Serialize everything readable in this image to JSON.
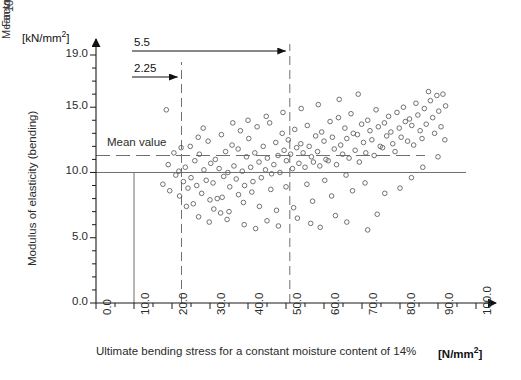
{
  "chart_data": {
    "type": "scatter",
    "title": "",
    "xlabel": "Ultimate bending stress for a constant moisture content of 14%",
    "xunit": "[N/mm2]",
    "ylabel": "Modulus of elasticity (bending)",
    "yunit": "[kN/mm2]",
    "xlim": [
      0.0,
      100.0
    ],
    "ylim": [
      0.0,
      19.0
    ],
    "xticks": [
      "0.0",
      "10.0",
      "20.0",
      "30.0",
      "40.0",
      "50.0",
      "60.0",
      "70.0",
      "80.0",
      "90.0",
      "100.0"
    ],
    "xtick_values": [
      0,
      10,
      20,
      30,
      40,
      50,
      60,
      70,
      80,
      90,
      100
    ],
    "xminor_step": 5,
    "yticks": [
      "0.0",
      "5.0",
      "10.0",
      "15.0",
      "19.0"
    ],
    "ytick_values": [
      0,
      5,
      10,
      15,
      19
    ],
    "yminor_step": 1,
    "grid": false,
    "legend": "none",
    "marker": "open-circle",
    "annotations": {
      "dim_upper_label": "5.5",
      "dim_upper_from": 10.0,
      "dim_upper_to": 51.0,
      "dim_lower_label": "2.25",
      "dim_lower_from": 10.0,
      "dim_lower_to": 22.5,
      "mean_value_horizontal_label": "Mean value",
      "mean_value_horizontal_y": 11.3,
      "mean_value_vertical_label": "Mean value",
      "mean_value_vertical_x": 51.0,
      "permissible_stress_label_line1": "Permissible stress",
      "permissible_stress_label_line2": "10 N/mm",
      "permissible_stress_label_sup": "2",
      "permissible_stress_x": 10.0,
      "permissible_stress_y_top": 10.0,
      "factor_of_safety_label": "Factor of safety",
      "factor_of_safety_x": 22.5,
      "solid_ref_y": 10.0
    },
    "points": [
      [
        18.5,
        14.8
      ],
      [
        19.0,
        10.6
      ],
      [
        17.6,
        9.1
      ],
      [
        19.4,
        8.6
      ],
      [
        21.0,
        9.8
      ],
      [
        22.0,
        8.2
      ],
      [
        21.8,
        10.1
      ],
      [
        23.0,
        9.3
      ],
      [
        23.5,
        10.4
      ],
      [
        24.2,
        8.8
      ],
      [
        25.0,
        9.6
      ],
      [
        25.6,
        7.6
      ],
      [
        26.0,
        10.9
      ],
      [
        26.5,
        9.0
      ],
      [
        27.2,
        11.4
      ],
      [
        27.8,
        8.4
      ],
      [
        28.4,
        10.2
      ],
      [
        29.0,
        9.4
      ],
      [
        29.5,
        12.4
      ],
      [
        30.2,
        10.7
      ],
      [
        30.8,
        9.2
      ],
      [
        31.4,
        11.0
      ],
      [
        31.9,
        8.0
      ],
      [
        32.4,
        10.3
      ],
      [
        33.0,
        12.9
      ],
      [
        33.6,
        9.7
      ],
      [
        34.1,
        11.6
      ],
      [
        34.7,
        10.0
      ],
      [
        35.2,
        8.9
      ],
      [
        35.8,
        12.1
      ],
      [
        36.3,
        10.5
      ],
      [
        36.9,
        9.5
      ],
      [
        37.4,
        11.8
      ],
      [
        38.0,
        13.2
      ],
      [
        38.5,
        10.1
      ],
      [
        39.1,
        9.0
      ],
      [
        39.6,
        11.2
      ],
      [
        40.2,
        12.6
      ],
      [
        40.7,
        10.4
      ],
      [
        41.3,
        9.3
      ],
      [
        41.8,
        11.5
      ],
      [
        42.4,
        13.5
      ],
      [
        42.9,
        10.8
      ],
      [
        43.5,
        9.6
      ],
      [
        44.0,
        12.0
      ],
      [
        44.6,
        10.2
      ],
      [
        45.1,
        11.1
      ],
      [
        45.7,
        13.8
      ],
      [
        46.2,
        9.9
      ],
      [
        46.8,
        10.6
      ],
      [
        47.3,
        12.3
      ],
      [
        47.9,
        11.3
      ],
      [
        48.4,
        10.0
      ],
      [
        49.0,
        13.0
      ],
      [
        49.5,
        11.7
      ],
      [
        50.1,
        10.9
      ],
      [
        50.6,
        12.5
      ],
      [
        51.2,
        11.4
      ],
      [
        51.7,
        10.3
      ],
      [
        52.3,
        13.3
      ],
      [
        52.8,
        11.9
      ],
      [
        53.4,
        10.7
      ],
      [
        53.9,
        12.2
      ],
      [
        54.5,
        11.5
      ],
      [
        55.0,
        10.4
      ],
      [
        55.6,
        13.6
      ],
      [
        56.1,
        12.0
      ],
      [
        56.7,
        11.2
      ],
      [
        57.2,
        10.8
      ],
      [
        57.8,
        12.8
      ],
      [
        58.3,
        11.6
      ],
      [
        58.9,
        10.5
      ],
      [
        59.4,
        13.1
      ],
      [
        60.0,
        12.4
      ],
      [
        60.5,
        11.0
      ],
      [
        61.1,
        10.9
      ],
      [
        61.6,
        13.9
      ],
      [
        62.2,
        12.7
      ],
      [
        62.7,
        11.8
      ],
      [
        63.3,
        10.6
      ],
      [
        63.8,
        14.2
      ],
      [
        64.4,
        12.1
      ],
      [
        64.9,
        11.4
      ],
      [
        65.5,
        13.4
      ],
      [
        66.0,
        12.6
      ],
      [
        66.6,
        11.1
      ],
      [
        67.1,
        14.5
      ],
      [
        67.7,
        13.0
      ],
      [
        68.2,
        11.7
      ],
      [
        68.8,
        12.9
      ],
      [
        69.3,
        10.8
      ],
      [
        69.9,
        13.7
      ],
      [
        70.4,
        12.3
      ],
      [
        71.0,
        11.5
      ],
      [
        71.5,
        14.0
      ],
      [
        72.1,
        13.2
      ],
      [
        72.6,
        12.5
      ],
      [
        73.2,
        11.3
      ],
      [
        73.7,
        14.8
      ],
      [
        74.3,
        13.5
      ],
      [
        74.8,
        12.0
      ],
      [
        75.4,
        11.9
      ],
      [
        75.9,
        13.8
      ],
      [
        76.5,
        12.8
      ],
      [
        77.0,
        14.3
      ],
      [
        77.6,
        13.1
      ],
      [
        78.1,
        12.2
      ],
      [
        78.7,
        11.6
      ],
      [
        79.2,
        14.6
      ],
      [
        79.8,
        13.4
      ],
      [
        80.3,
        12.7
      ],
      [
        80.9,
        15.0
      ],
      [
        81.4,
        13.9
      ],
      [
        82.0,
        12.4
      ],
      [
        82.5,
        14.1
      ],
      [
        83.1,
        13.6
      ],
      [
        83.6,
        12.1
      ],
      [
        84.2,
        15.3
      ],
      [
        84.7,
        14.4
      ],
      [
        85.3,
        13.2
      ],
      [
        85.8,
        12.6
      ],
      [
        86.4,
        14.9
      ],
      [
        86.9,
        13.7
      ],
      [
        87.5,
        16.2
      ],
      [
        88.0,
        15.5
      ],
      [
        88.6,
        14.2
      ],
      [
        89.1,
        13.0
      ],
      [
        89.7,
        15.9
      ],
      [
        90.2,
        14.7
      ],
      [
        90.8,
        13.5
      ],
      [
        91.3,
        16.0
      ],
      [
        92.0,
        15.1
      ],
      [
        24.8,
        12.0
      ],
      [
        26.9,
        12.7
      ],
      [
        28.2,
        13.4
      ],
      [
        30.0,
        7.9
      ],
      [
        31.0,
        7.2
      ],
      [
        33.2,
        8.1
      ],
      [
        35.0,
        7.0
      ],
      [
        36.0,
        13.8
      ],
      [
        37.5,
        8.3
      ],
      [
        38.8,
        7.7
      ],
      [
        40.0,
        14.0
      ],
      [
        41.0,
        8.5
      ],
      [
        43.0,
        7.4
      ],
      [
        44.8,
        14.3
      ],
      [
        46.0,
        8.7
      ],
      [
        47.5,
        7.1
      ],
      [
        49.2,
        14.6
      ],
      [
        50.0,
        8.9
      ],
      [
        52.0,
        7.3
      ],
      [
        54.0,
        14.9
      ],
      [
        55.5,
        9.1
      ],
      [
        57.0,
        7.8
      ],
      [
        58.5,
        15.2
      ],
      [
        60.2,
        9.4
      ],
      [
        62.0,
        8.2
      ],
      [
        64.0,
        15.6
      ],
      [
        65.8,
        9.8
      ],
      [
        67.5,
        8.6
      ],
      [
        69.0,
        16.0
      ],
      [
        70.8,
        9.2
      ],
      [
        20.5,
        11.5
      ],
      [
        22.4,
        11.9
      ],
      [
        23.8,
        7.4
      ],
      [
        27.0,
        6.6
      ],
      [
        29.8,
        6.2
      ],
      [
        32.8,
        6.9
      ],
      [
        34.5,
        6.4
      ],
      [
        39.0,
        6.0
      ],
      [
        42.0,
        5.7
      ],
      [
        45.0,
        6.3
      ],
      [
        48.0,
        5.9
      ],
      [
        53.0,
        6.5
      ],
      [
        56.5,
        6.1
      ],
      [
        59.0,
        5.8
      ],
      [
        63.0,
        6.7
      ],
      [
        66.0,
        6.2
      ],
      [
        71.5,
        5.6
      ],
      [
        74.0,
        6.8
      ],
      [
        76.0,
        8.4
      ],
      [
        80.0,
        8.8
      ],
      [
        83.0,
        9.6
      ],
      [
        86.0,
        10.4
      ],
      [
        90.0,
        11.2
      ],
      [
        91.8,
        12.5
      ]
    ]
  }
}
